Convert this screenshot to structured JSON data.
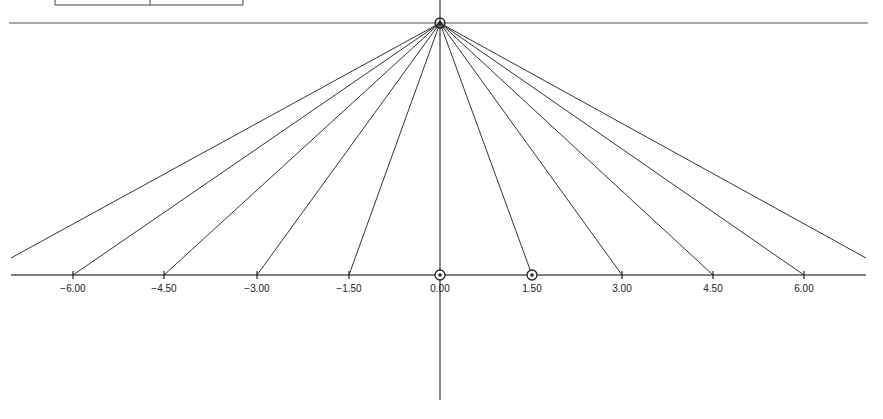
{
  "diagram": {
    "type": "ray-fan-projection",
    "apex": {
      "x": 440,
      "y": 23
    },
    "axis_y": 275,
    "ticks": [
      {
        "label": "−6.00",
        "value": -6.0,
        "x": 73
      },
      {
        "label": "−4.50",
        "value": -4.5,
        "x": 164
      },
      {
        "label": "−3.00",
        "value": -3.0,
        "x": 257
      },
      {
        "label": "−1.50",
        "value": -1.5,
        "x": 349
      },
      {
        "label": "0.00",
        "value": 0.0,
        "x": 440,
        "marker": "circle-dot"
      },
      {
        "label": "1.50",
        "value": 1.5,
        "x": 532,
        "marker": "circle-dot"
      },
      {
        "label": "3.00",
        "value": 3.0,
        "x": 622
      },
      {
        "label": "4.50",
        "value": 4.5,
        "x": 713
      },
      {
        "label": "6.00",
        "value": 6.0,
        "x": 804
      }
    ],
    "outer_rays": [
      {
        "x": 11,
        "y": 258
      },
      {
        "x": 866,
        "y": 258
      }
    ],
    "line_color": "#333333"
  }
}
